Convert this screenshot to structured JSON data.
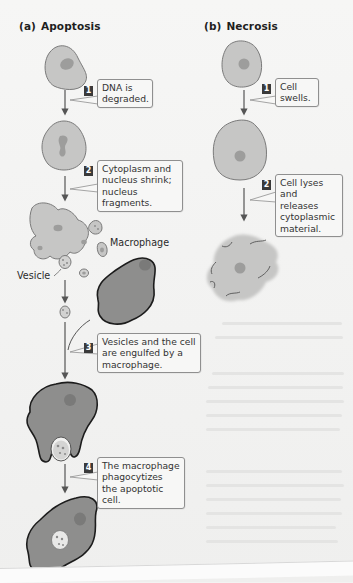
{
  "figure": {
    "panels": [
      {
        "id": "apoptosis",
        "tag": "(a)",
        "title": "Apoptosis",
        "steps": [
          {
            "number": "1",
            "text": "DNA is degraded."
          },
          {
            "number": "2",
            "text": "Cytoplasm and nucleus shrink; nucleus fragments."
          },
          {
            "number": "3",
            "text": "Vesicles and the cell are engulfed by a macrophage."
          },
          {
            "number": "4",
            "text": "The macrophage phagocytizes the apoptotic cell."
          }
        ],
        "labels": {
          "macrophage": "Macrophage",
          "vesicle": "Vesicle"
        }
      },
      {
        "id": "necrosis",
        "tag": "(b)",
        "title": "Necrosis",
        "steps": [
          {
            "number": "1",
            "text": "Cell swells."
          },
          {
            "number": "2",
            "text": "Cell lyses and releases cytoplasmic material."
          }
        ]
      }
    ],
    "colors": {
      "cell_fill": "#c6c6c5",
      "cell_stroke": "#7a7a7a",
      "nucleus": "#9d9d9c",
      "macrophage_fill": "#8e8e8d",
      "macrophage_stroke": "#1c1c1c",
      "arrow": "#555555",
      "badge": "#3a3a3a",
      "callout_border": "#8f8f8f"
    }
  }
}
